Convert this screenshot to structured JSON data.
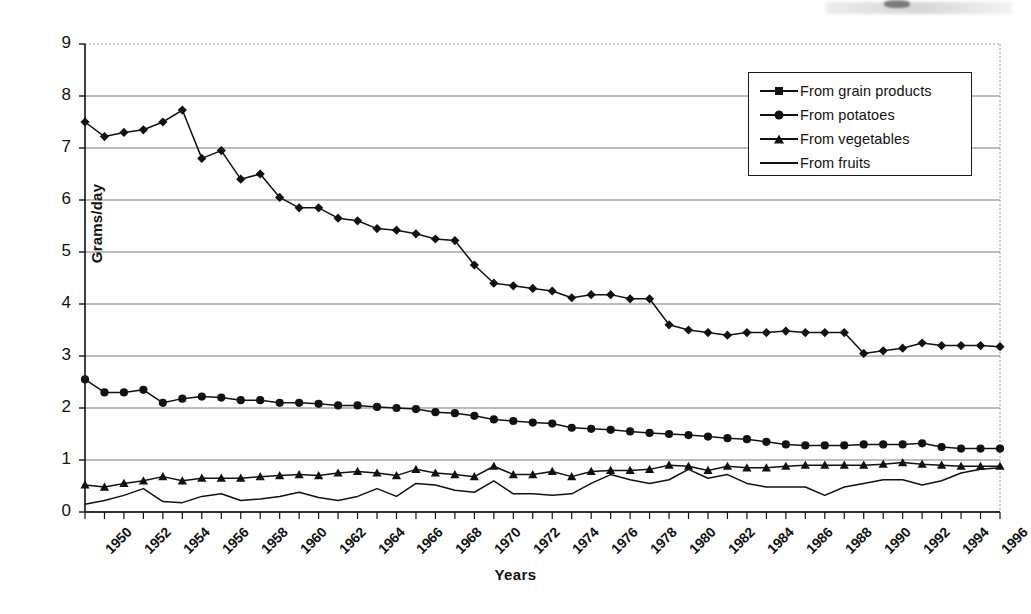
{
  "chart_data": {
    "type": "line",
    "title": "",
    "xlabel": "Years",
    "ylabel": "Grams/day",
    "xlim": [
      1950,
      1997
    ],
    "ylim": [
      0,
      9
    ],
    "yticks": [
      0,
      1,
      2,
      3,
      4,
      5,
      6,
      7,
      8,
      9
    ],
    "grid": "horizontal",
    "legend_position": "top-right",
    "x": [
      1950,
      1951,
      1952,
      1953,
      1954,
      1955,
      1956,
      1957,
      1958,
      1959,
      1960,
      1961,
      1962,
      1963,
      1964,
      1965,
      1966,
      1967,
      1968,
      1969,
      1970,
      1971,
      1972,
      1973,
      1974,
      1975,
      1976,
      1977,
      1978,
      1979,
      1980,
      1981,
      1982,
      1983,
      1984,
      1985,
      1986,
      1987,
      1988,
      1989,
      1990,
      1991,
      1992,
      1993,
      1994,
      1995,
      1996,
      1997
    ],
    "xtick_labels": [
      "1950",
      "1952",
      "1954",
      "1956",
      "1958",
      "1960",
      "1962",
      "1964",
      "1966",
      "1968",
      "1970",
      "1972",
      "1974",
      "1976",
      "1978",
      "1980",
      "1982",
      "1984",
      "1986",
      "1988",
      "1990",
      "1992",
      "1994",
      "1996"
    ],
    "series": [
      {
        "name": "From grain products",
        "marker": "diamond",
        "values": [
          7.5,
          7.22,
          7.3,
          7.35,
          7.5,
          7.73,
          6.8,
          6.95,
          6.4,
          6.5,
          6.05,
          5.85,
          5.85,
          5.65,
          5.6,
          5.45,
          5.42,
          5.35,
          5.25,
          5.22,
          4.75,
          4.4,
          4.35,
          4.3,
          4.25,
          4.12,
          4.18,
          4.18,
          4.1,
          4.1,
          3.6,
          3.5,
          3.45,
          3.4,
          3.45,
          3.45,
          3.48,
          3.45,
          3.45,
          3.45,
          3.05,
          3.1,
          3.15,
          3.25,
          3.2,
          3.2,
          3.2,
          3.18
        ]
      },
      {
        "name": "From potatoes",
        "marker": "circle",
        "values": [
          2.55,
          2.3,
          2.3,
          2.35,
          2.1,
          2.18,
          2.22,
          2.2,
          2.15,
          2.15,
          2.1,
          2.1,
          2.08,
          2.05,
          2.05,
          2.02,
          2.0,
          1.98,
          1.92,
          1.9,
          1.85,
          1.78,
          1.75,
          1.72,
          1.7,
          1.62,
          1.6,
          1.58,
          1.55,
          1.52,
          1.5,
          1.48,
          1.45,
          1.42,
          1.4,
          1.35,
          1.3,
          1.28,
          1.28,
          1.28,
          1.3,
          1.3,
          1.3,
          1.32,
          1.25,
          1.22,
          1.22,
          1.22
        ]
      },
      {
        "name": "From vegetables",
        "marker": "triangle",
        "values": [
          0.52,
          0.48,
          0.55,
          0.6,
          0.68,
          0.6,
          0.65,
          0.65,
          0.65,
          0.68,
          0.7,
          0.72,
          0.7,
          0.75,
          0.78,
          0.75,
          0.7,
          0.82,
          0.75,
          0.72,
          0.68,
          0.88,
          0.72,
          0.72,
          0.78,
          0.68,
          0.78,
          0.8,
          0.8,
          0.82,
          0.9,
          0.88,
          0.8,
          0.88,
          0.85,
          0.85,
          0.88,
          0.9,
          0.9,
          0.9,
          0.9,
          0.92,
          0.95,
          0.92,
          0.9,
          0.88,
          0.88,
          0.88
        ]
      },
      {
        "name": "From fruits",
        "marker": "none",
        "values": [
          0.15,
          0.22,
          0.32,
          0.45,
          0.2,
          0.18,
          0.3,
          0.35,
          0.22,
          0.25,
          0.3,
          0.38,
          0.28,
          0.22,
          0.3,
          0.45,
          0.3,
          0.55,
          0.52,
          0.42,
          0.38,
          0.6,
          0.35,
          0.35,
          0.32,
          0.35,
          0.55,
          0.72,
          0.62,
          0.55,
          0.62,
          0.82,
          0.65,
          0.72,
          0.55,
          0.48,
          0.48,
          0.48,
          0.32,
          0.48,
          0.55,
          0.62,
          0.62,
          0.52,
          0.6,
          0.75,
          0.82,
          0.85
        ]
      }
    ]
  },
  "legend": {
    "items": [
      {
        "label": "From grain products",
        "marker": "diamond"
      },
      {
        "label": "From potatoes",
        "marker": "circle"
      },
      {
        "label": "From vegetables",
        "marker": "triangle"
      },
      {
        "label": "From fruits",
        "marker": "none"
      }
    ]
  },
  "axes": {
    "y_title": "Grams/day",
    "x_title": "Years"
  },
  "colors": {
    "ink": "#111111",
    "grid": "#7a7a7a",
    "background": "#ffffff"
  }
}
